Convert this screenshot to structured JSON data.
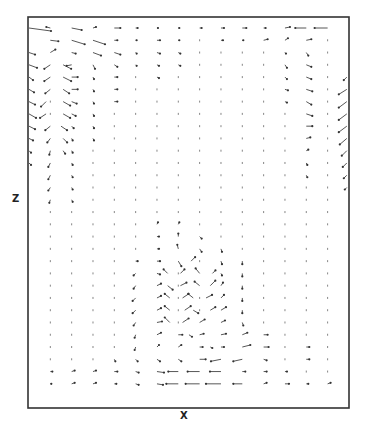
{
  "chart_data": {
    "type": "quiver",
    "title": "",
    "xlabel": "x",
    "ylabel": "z",
    "grid": false,
    "legend": null,
    "frame": {
      "left": 28,
      "top": 17,
      "right": 349,
      "bottom": 408
    },
    "grid_layout": {
      "cols": 16,
      "rows": 31,
      "x0": 29,
      "dx": 21.33,
      "y0": 28,
      "dy": 12.27
    },
    "note": "Vectors listed as [col, row, u, v] in screen pixels (u right-positive, v down-positive). Unlisted grid points are tiny dots.",
    "vectors": [
      [
        0,
        0,
        22,
        3
      ],
      [
        1,
        0,
        -4,
        -1
      ],
      [
        2,
        0,
        10,
        2
      ],
      [
        3,
        0,
        3,
        -1
      ],
      [
        4,
        0,
        6,
        0
      ],
      [
        5,
        0,
        2,
        0
      ],
      [
        6,
        0,
        1,
        0
      ],
      [
        7,
        0,
        1,
        0
      ],
      [
        8,
        0,
        2,
        0
      ],
      [
        9,
        0,
        3,
        0
      ],
      [
        10,
        0,
        4,
        0
      ],
      [
        11,
        0,
        2,
        0
      ],
      [
        12,
        0,
        5,
        -1
      ],
      [
        13,
        0,
        -11,
        0
      ],
      [
        14,
        0,
        -13,
        0
      ],
      [
        1,
        1,
        8,
        1
      ],
      [
        2,
        1,
        13,
        4
      ],
      [
        3,
        1,
        12,
        4
      ],
      [
        4,
        1,
        3,
        0
      ],
      [
        5,
        1,
        1,
        0
      ],
      [
        6,
        1,
        3,
        0
      ],
      [
        7,
        1,
        1,
        0
      ],
      [
        9,
        1,
        2,
        0
      ],
      [
        10,
        1,
        1,
        0
      ],
      [
        11,
        1,
        4,
        -1
      ],
      [
        12,
        1,
        3,
        -2
      ],
      [
        13,
        1,
        5,
        -1
      ],
      [
        0,
        2,
        6,
        2
      ],
      [
        1,
        2,
        5,
        -3
      ],
      [
        2,
        2,
        4,
        1
      ],
      [
        3,
        2,
        8,
        3
      ],
      [
        4,
        2,
        6,
        2
      ],
      [
        5,
        2,
        1,
        1
      ],
      [
        6,
        2,
        3,
        1
      ],
      [
        7,
        2,
        2,
        1
      ],
      [
        12,
        2,
        1,
        1
      ],
      [
        13,
        2,
        2,
        3
      ],
      [
        0,
        3,
        8,
        3
      ],
      [
        1,
        3,
        -6,
        4
      ],
      [
        1.6,
        3,
        8,
        4
      ],
      [
        2,
        3,
        -5,
        1
      ],
      [
        3,
        3,
        2,
        4
      ],
      [
        4,
        3,
        3,
        2
      ],
      [
        5,
        3,
        1,
        1
      ],
      [
        6,
        3,
        2,
        1
      ],
      [
        7,
        3,
        2,
        1
      ],
      [
        12,
        3,
        2,
        3
      ],
      [
        13,
        3,
        5,
        2
      ],
      [
        0,
        4,
        4,
        3
      ],
      [
        1,
        4,
        -6,
        4
      ],
      [
        1.6,
        4,
        8,
        4
      ],
      [
        2,
        4,
        6,
        0
      ],
      [
        3,
        4,
        1,
        2
      ],
      [
        4,
        4,
        3,
        0
      ],
      [
        6,
        4,
        2,
        1
      ],
      [
        12,
        4,
        2,
        2
      ],
      [
        13,
        4,
        5,
        2
      ],
      [
        14.9,
        4,
        -3,
        3
      ],
      [
        0,
        5,
        5,
        3
      ],
      [
        1,
        5,
        -5,
        4
      ],
      [
        1.6,
        5,
        6,
        4
      ],
      [
        2,
        5,
        6,
        0
      ],
      [
        3,
        5,
        1,
        2
      ],
      [
        4,
        5,
        3,
        0
      ],
      [
        12,
        5,
        3,
        1
      ],
      [
        13,
        5,
        6,
        2
      ],
      [
        14.9,
        5,
        -8,
        5
      ],
      [
        0,
        6,
        6,
        3
      ],
      [
        0.8,
        6,
        -5,
        5
      ],
      [
        1.6,
        6,
        7,
        4
      ],
      [
        2,
        6,
        5,
        2
      ],
      [
        3,
        6,
        1,
        2
      ],
      [
        4,
        6,
        3,
        0
      ],
      [
        12,
        6,
        2,
        1
      ],
      [
        13,
        6,
        5,
        3
      ],
      [
        14.9,
        6,
        -8,
        6
      ],
      [
        0,
        7,
        7,
        4
      ],
      [
        0.8,
        7,
        -6,
        4
      ],
      [
        1.6,
        7,
        7,
        4
      ],
      [
        2,
        7,
        4,
        2
      ],
      [
        3,
        7,
        1,
        2
      ],
      [
        13,
        7,
        6,
        2
      ],
      [
        14.9,
        7,
        -8,
        6
      ],
      [
        0,
        8,
        6,
        3
      ],
      [
        1,
        8,
        -5,
        4
      ],
      [
        1.5,
        8,
        6,
        4
      ],
      [
        2,
        8,
        2,
        2
      ],
      [
        3,
        8,
        1,
        2
      ],
      [
        13,
        8,
        6,
        0
      ],
      [
        14.9,
        8,
        -8,
        6
      ],
      [
        0,
        9,
        4,
        2
      ],
      [
        1,
        9,
        -3,
        4
      ],
      [
        1.6,
        9,
        4,
        4
      ],
      [
        2,
        9,
        1,
        2
      ],
      [
        3,
        9,
        1,
        2
      ],
      [
        13,
        9,
        4,
        -1
      ],
      [
        14.9,
        9,
        -7,
        6
      ],
      [
        0,
        10,
        2,
        2
      ],
      [
        1,
        10,
        -1,
        4
      ],
      [
        1.6,
        10,
        2,
        3
      ],
      [
        2,
        10,
        1,
        2
      ],
      [
        13,
        10,
        2,
        -1
      ],
      [
        14.9,
        10,
        -5,
        5
      ],
      [
        0,
        11,
        2,
        2
      ],
      [
        1,
        11,
        -2,
        4
      ],
      [
        2,
        11,
        1,
        2
      ],
      [
        13,
        11,
        1,
        2
      ],
      [
        14.9,
        11,
        -4,
        4
      ],
      [
        1,
        12,
        -2,
        4
      ],
      [
        2,
        12,
        1,
        2
      ],
      [
        13,
        12,
        1,
        2
      ],
      [
        14.9,
        12,
        -3,
        3
      ],
      [
        1,
        13,
        -2,
        3
      ],
      [
        2,
        13,
        1,
        2
      ],
      [
        14.9,
        13,
        -2,
        2
      ],
      [
        1,
        14,
        -1,
        3
      ],
      [
        2,
        14,
        1,
        2
      ],
      [
        6,
        16,
        1,
        -2
      ],
      [
        7,
        16,
        1,
        -2
      ],
      [
        6,
        17,
        2,
        0
      ],
      [
        7,
        17,
        0,
        -3
      ],
      [
        8,
        17,
        2,
        2
      ],
      [
        6,
        18,
        2,
        0
      ],
      [
        7,
        18,
        -1,
        -4
      ],
      [
        8,
        18,
        2,
        3
      ],
      [
        9,
        18,
        1,
        3
      ],
      [
        5,
        19,
        2,
        0
      ],
      [
        6,
        19,
        3,
        0
      ],
      [
        7,
        19,
        3,
        5
      ],
      [
        7.6,
        19,
        4,
        -4
      ],
      [
        9,
        19,
        1,
        3
      ],
      [
        10,
        19,
        0,
        3
      ],
      [
        5,
        20,
        -2,
        2
      ],
      [
        6,
        20,
        3,
        1
      ],
      [
        6.5,
        20,
        -4,
        -4
      ],
      [
        7.1,
        20,
        4,
        -4
      ],
      [
        8,
        20,
        -4,
        -5
      ],
      [
        8.6,
        20,
        3,
        -3
      ],
      [
        9,
        20,
        1,
        2
      ],
      [
        10,
        20,
        0,
        3
      ],
      [
        5,
        21,
        -2,
        3
      ],
      [
        6,
        21,
        4,
        -2
      ],
      [
        6.5,
        21,
        5,
        4
      ],
      [
        7.1,
        21,
        6,
        -3
      ],
      [
        8,
        21,
        -5,
        -4
      ],
      [
        8.5,
        21,
        5,
        -5
      ],
      [
        9,
        21,
        2,
        -3
      ],
      [
        10,
        21,
        0,
        3
      ],
      [
        5,
        22,
        -3,
        3
      ],
      [
        6,
        22,
        4,
        -2
      ],
      [
        6.6,
        22,
        -5,
        -4
      ],
      [
        7.2,
        22,
        6,
        -4
      ],
      [
        7.7,
        22,
        -5,
        -4
      ],
      [
        8.3,
        22,
        6,
        -3
      ],
      [
        9,
        22,
        3,
        -3
      ],
      [
        10,
        22,
        0,
        3
      ],
      [
        5,
        23,
        -3,
        3
      ],
      [
        6,
        23,
        4,
        -2
      ],
      [
        6.6,
        23,
        -5,
        -4
      ],
      [
        7.3,
        23,
        6,
        -4
      ],
      [
        7.7,
        23,
        5,
        3
      ],
      [
        8.5,
        23,
        5,
        -3
      ],
      [
        9,
        23,
        5,
        -3
      ],
      [
        10,
        23,
        0,
        3
      ],
      [
        5,
        24,
        -2,
        3
      ],
      [
        6,
        24,
        5,
        -1
      ],
      [
        6.6,
        24,
        -5,
        -5
      ],
      [
        7.2,
        24,
        6,
        -4
      ],
      [
        8,
        24,
        5,
        -3
      ],
      [
        9,
        24,
        4,
        -2
      ],
      [
        10,
        24,
        1,
        3
      ],
      [
        5,
        25,
        -1,
        3
      ],
      [
        6,
        25,
        4,
        -2
      ],
      [
        7,
        25,
        4,
        0
      ],
      [
        7.5,
        25,
        3,
        2
      ],
      [
        8,
        25,
        4,
        -1
      ],
      [
        9,
        25,
        5,
        -1
      ],
      [
        10,
        25,
        5,
        -2
      ],
      [
        11,
        25,
        4,
        0
      ],
      [
        5,
        26,
        -1,
        3
      ],
      [
        6,
        26,
        2,
        -2
      ],
      [
        7,
        26,
        3,
        -2
      ],
      [
        8,
        26,
        3,
        0
      ],
      [
        8.5,
        26,
        2,
        1
      ],
      [
        9,
        26,
        3,
        0
      ],
      [
        10,
        26,
        8,
        -2
      ],
      [
        11,
        26,
        5,
        0
      ],
      [
        13,
        26,
        3,
        0
      ],
      [
        4,
        27,
        1,
        2
      ],
      [
        5,
        27,
        2,
        2
      ],
      [
        6,
        27,
        3,
        2
      ],
      [
        7,
        27,
        3,
        2
      ],
      [
        8,
        27,
        6,
        0
      ],
      [
        9,
        27,
        -10,
        2
      ],
      [
        10,
        27,
        -9,
        2
      ],
      [
        11,
        27,
        3,
        1
      ],
      [
        13,
        27,
        3,
        0
      ],
      [
        1,
        28,
        2,
        0
      ],
      [
        2,
        28,
        3,
        -1
      ],
      [
        3,
        28,
        3,
        -1
      ],
      [
        4,
        28,
        3,
        0
      ],
      [
        5,
        28,
        3,
        1
      ],
      [
        6,
        28,
        7,
        1
      ],
      [
        7,
        28,
        -10,
        0
      ],
      [
        8,
        28,
        -12,
        0
      ],
      [
        9,
        28,
        -11,
        0
      ],
      [
        10,
        28,
        3,
        0
      ],
      [
        11,
        28,
        3,
        0
      ],
      [
        12,
        28,
        2,
        0
      ],
      [
        1,
        29,
        1,
        0
      ],
      [
        2,
        29,
        3,
        -1
      ],
      [
        3,
        29,
        3,
        -1
      ],
      [
        4,
        29,
        2,
        0
      ],
      [
        5,
        29,
        3,
        1
      ],
      [
        6,
        29,
        6,
        1
      ],
      [
        7,
        29,
        -12,
        0
      ],
      [
        8,
        29,
        -14,
        0
      ],
      [
        9,
        29,
        -15,
        0
      ],
      [
        10,
        29,
        -9,
        0
      ],
      [
        11,
        29,
        3,
        -1
      ],
      [
        12,
        29,
        4,
        0
      ],
      [
        13,
        29,
        2,
        0
      ],
      [
        14,
        29,
        3,
        -1
      ]
    ]
  },
  "axes": {
    "x_label": "X",
    "z_label": "Z"
  }
}
